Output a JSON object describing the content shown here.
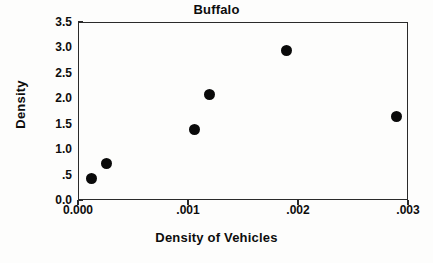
{
  "chart_data": {
    "type": "scatter",
    "title": "Buffalo",
    "xlabel": "Density of Vehicles",
    "ylabel": "Density",
    "xlim": [
      0.0,
      0.003
    ],
    "ylim": [
      0.0,
      3.5
    ],
    "grid": false,
    "legend": null,
    "x_tick_values": [
      0.0,
      0.001,
      0.002,
      0.003
    ],
    "x_tick_labels": [
      "0.000",
      ".001",
      ".002",
      ".003"
    ],
    "y_tick_values": [
      0.0,
      0.5,
      1.0,
      1.5,
      2.0,
      2.5,
      3.0,
      3.5
    ],
    "y_tick_labels": [
      "0.0",
      ".5",
      "1.0",
      "1.5",
      "2.0",
      "2.5",
      "3.0",
      "3.5"
    ],
    "marker": "filled-circle",
    "marker_color": "#0a0a0a",
    "points": [
      {
        "x": 0.00011,
        "y": 0.45
      },
      {
        "x": 0.00025,
        "y": 0.73
      },
      {
        "x": 0.00105,
        "y": 1.4
      },
      {
        "x": 0.00119,
        "y": 2.1
      },
      {
        "x": 0.00189,
        "y": 2.95
      },
      {
        "x": 0.00289,
        "y": 1.67
      }
    ]
  },
  "colors": {
    "axis": "#2a2a2a",
    "text": "#0d0d0d",
    "background": "#fdfdfc"
  }
}
